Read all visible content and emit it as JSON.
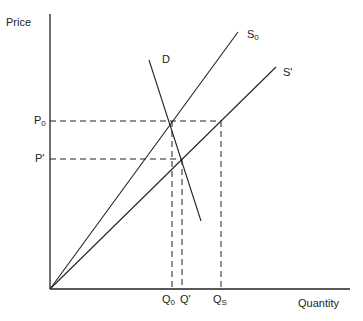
{
  "axes": {
    "y_label": "Price",
    "x_label": "Quantity"
  },
  "curves": {
    "supply_initial": {
      "label": "S",
      "subscript": "0"
    },
    "supply_new": {
      "label": "S'"
    },
    "demand": {
      "label": "D"
    }
  },
  "price_levels": {
    "p0": {
      "label": "P",
      "subscript": "0"
    },
    "p_prime": {
      "label": "P'"
    }
  },
  "quantity_levels": {
    "q0": {
      "label": "Q",
      "subscript": "0"
    },
    "q_prime": {
      "label": "Q'"
    },
    "qs": {
      "label": "Q",
      "subscript": "S"
    }
  },
  "colors": {
    "line": "#222222",
    "background": "#ffffff"
  }
}
